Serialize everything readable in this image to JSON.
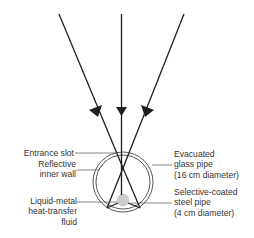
{
  "diagram": {
    "title": "",
    "colors": {
      "ray": "#1f1f1f",
      "pipe_outline": "#444444",
      "steel_pipe_fill": "#cccccc",
      "label_text": "#333333",
      "leader": "#555555"
    },
    "labels": {
      "entrance_slot": "Entrance slot",
      "reflective_inner_wall_1": "Reflective",
      "reflective_inner_wall_2": "inner wall",
      "liquid_metal_1": "Liquid-metal",
      "liquid_metal_2": "heat-transfer",
      "liquid_metal_3": "fluid",
      "evacuated_glass_1": "Evacuated",
      "evacuated_glass_2": "glass pipe",
      "evacuated_glass_3": "(16 cm diameter)",
      "steel_pipe_1": "Selective-coated",
      "steel_pipe_2": "steel pipe",
      "steel_pipe_3": "(4 cm diameter)"
    },
    "components": {
      "incoming_rays": 3,
      "glass_pipe_diameter": "16 cm",
      "steel_pipe_diameter": "4 cm"
    }
  }
}
